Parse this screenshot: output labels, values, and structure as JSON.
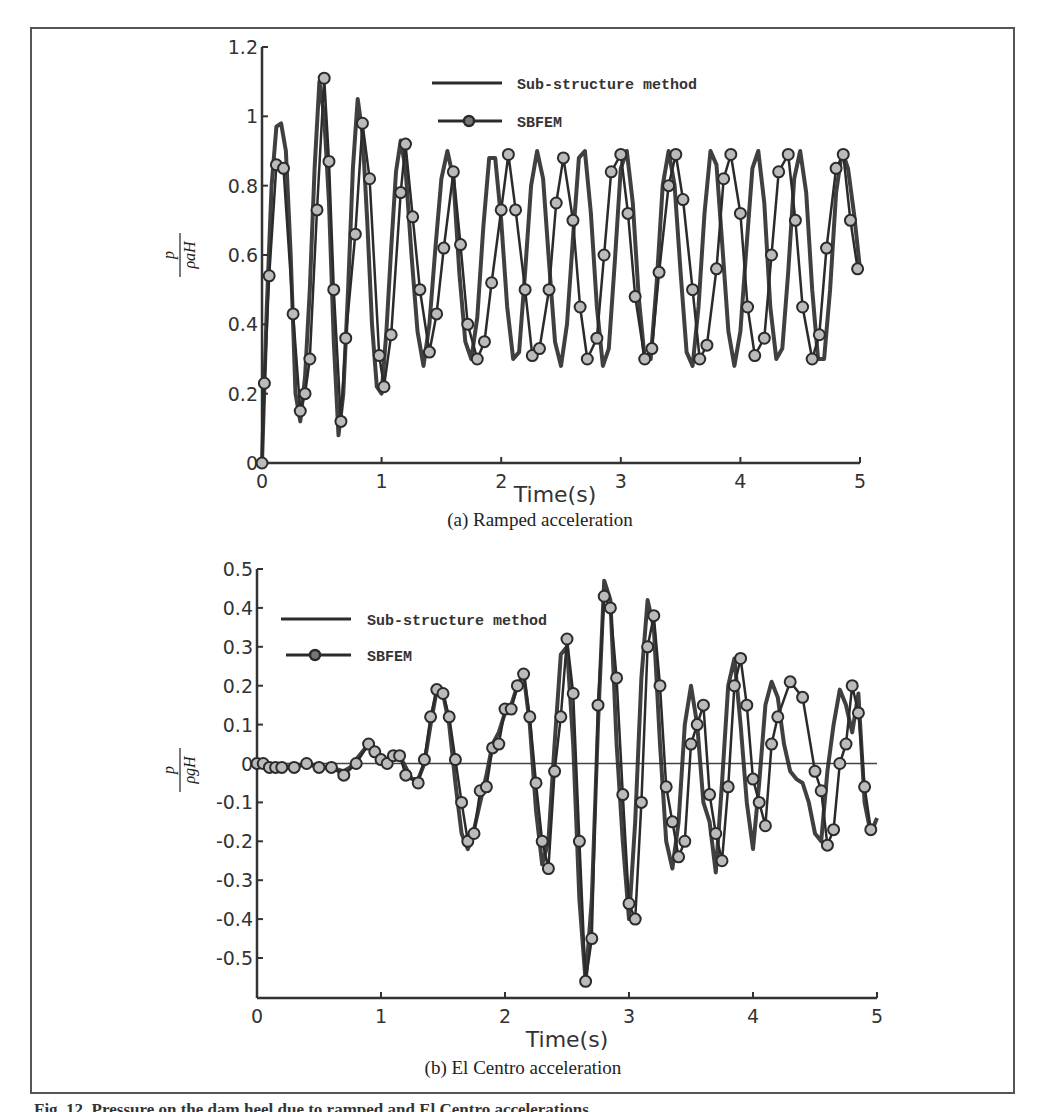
{
  "figure": {
    "caption": "Fig. 12. Pressure on the dam heel due to ramped and El Centro accelerations",
    "frame_color": "#555555",
    "line_color": "#2b2b2b"
  },
  "chart_data": [
    {
      "type": "line",
      "panel": "a",
      "subcaption": "(a) Ramped acceleration",
      "title": "",
      "xlabel": "Time(s)",
      "ylabel": "p / ρ a H",
      "ylabel_num": "p",
      "ylabel_den": "ρaH",
      "xlim": [
        0,
        5
      ],
      "ylim": [
        0,
        1.2
      ],
      "xticks": [
        "0",
        "1",
        "2",
        "3",
        "4",
        "5"
      ],
      "yticks": [
        "0",
        "0.2",
        "0.4",
        "0.6",
        "0.8",
        "1",
        "1.2"
      ],
      "grid": false,
      "legend_position": "upper center",
      "legend": [
        "Sub-structure method",
        "SBFEM"
      ],
      "series": [
        {
          "name": "Sub-structure method",
          "marker": "none",
          "x": [
            0,
            0.04,
            0.08,
            0.12,
            0.16,
            0.2,
            0.24,
            0.28,
            0.32,
            0.36,
            0.4,
            0.44,
            0.48,
            0.52,
            0.56,
            0.6,
            0.64,
            0.68,
            0.72,
            0.76,
            0.8,
            0.84,
            0.88,
            0.92,
            0.96,
            1.0,
            1.04,
            1.08,
            1.12,
            1.16,
            1.2,
            1.25,
            1.3,
            1.35,
            1.4,
            1.45,
            1.5,
            1.55,
            1.6,
            1.65,
            1.7,
            1.75,
            1.8,
            1.85,
            1.9,
            1.95,
            2.0,
            2.05,
            2.1,
            2.15,
            2.2,
            2.25,
            2.3,
            2.35,
            2.4,
            2.45,
            2.5,
            2.55,
            2.6,
            2.65,
            2.7,
            2.75,
            2.8,
            2.85,
            2.9,
            2.95,
            3.0,
            3.05,
            3.1,
            3.15,
            3.2,
            3.25,
            3.3,
            3.35,
            3.4,
            3.45,
            3.5,
            3.55,
            3.6,
            3.65,
            3.7,
            3.75,
            3.8,
            3.85,
            3.9,
            3.95,
            4.0,
            4.05,
            4.1,
            4.15,
            4.2,
            4.25,
            4.3,
            4.35,
            4.4,
            4.45,
            4.5,
            4.55,
            4.6,
            4.65,
            4.7,
            4.75,
            4.8,
            4.85,
            4.9,
            4.95,
            5.0
          ],
          "values": [
            0,
            0.45,
            0.8,
            0.97,
            0.98,
            0.9,
            0.6,
            0.2,
            0.12,
            0.25,
            0.5,
            0.85,
            1.1,
            1.0,
            0.75,
            0.35,
            0.08,
            0.2,
            0.5,
            0.85,
            1.05,
            0.95,
            0.7,
            0.4,
            0.22,
            0.2,
            0.38,
            0.62,
            0.84,
            0.93,
            0.85,
            0.6,
            0.38,
            0.28,
            0.4,
            0.62,
            0.82,
            0.9,
            0.82,
            0.55,
            0.35,
            0.3,
            0.42,
            0.68,
            0.88,
            0.88,
            0.7,
            0.45,
            0.3,
            0.32,
            0.55,
            0.8,
            0.9,
            0.82,
            0.58,
            0.35,
            0.28,
            0.4,
            0.65,
            0.88,
            0.9,
            0.72,
            0.45,
            0.28,
            0.33,
            0.58,
            0.85,
            0.9,
            0.75,
            0.48,
            0.3,
            0.3,
            0.52,
            0.8,
            0.9,
            0.8,
            0.55,
            0.32,
            0.28,
            0.45,
            0.72,
            0.9,
            0.86,
            0.62,
            0.38,
            0.28,
            0.38,
            0.62,
            0.85,
            0.9,
            0.75,
            0.45,
            0.3,
            0.33,
            0.55,
            0.82,
            0.9,
            0.78,
            0.5,
            0.3,
            0.3,
            0.5,
            0.78,
            0.9,
            0.85,
            0.72,
            0.56
          ]
        },
        {
          "name": "SBFEM",
          "marker": "circle",
          "x": [
            0,
            0.02,
            0.06,
            0.12,
            0.18,
            0.26,
            0.32,
            0.36,
            0.4,
            0.46,
            0.52,
            0.56,
            0.6,
            0.66,
            0.7,
            0.78,
            0.84,
            0.9,
            0.98,
            1.02,
            1.08,
            1.16,
            1.2,
            1.26,
            1.32,
            1.4,
            1.46,
            1.52,
            1.6,
            1.66,
            1.72,
            1.8,
            1.86,
            1.92,
            2.0,
            2.06,
            2.12,
            2.2,
            2.26,
            2.32,
            2.4,
            2.46,
            2.52,
            2.6,
            2.66,
            2.72,
            2.8,
            2.86,
            2.92,
            3.0,
            3.06,
            3.12,
            3.2,
            3.26,
            3.32,
            3.4,
            3.46,
            3.52,
            3.6,
            3.66,
            3.72,
            3.8,
            3.86,
            3.92,
            4.0,
            4.06,
            4.12,
            4.2,
            4.26,
            4.32,
            4.4,
            4.46,
            4.52,
            4.6,
            4.66,
            4.72,
            4.8,
            4.86,
            4.92,
            4.98
          ],
          "values": [
            0,
            0.23,
            0.54,
            0.86,
            0.85,
            0.43,
            0.15,
            0.2,
            0.3,
            0.73,
            1.11,
            0.87,
            0.5,
            0.12,
            0.36,
            0.66,
            0.98,
            0.82,
            0.31,
            0.22,
            0.37,
            0.78,
            0.92,
            0.71,
            0.5,
            0.32,
            0.43,
            0.62,
            0.84,
            0.63,
            0.4,
            0.3,
            0.35,
            0.52,
            0.73,
            0.89,
            0.73,
            0.5,
            0.31,
            0.33,
            0.5,
            0.75,
            0.88,
            0.7,
            0.45,
            0.3,
            0.36,
            0.6,
            0.84,
            0.89,
            0.72,
            0.48,
            0.3,
            0.33,
            0.55,
            0.8,
            0.89,
            0.76,
            0.5,
            0.3,
            0.34,
            0.56,
            0.82,
            0.89,
            0.72,
            0.45,
            0.31,
            0.36,
            0.6,
            0.84,
            0.89,
            0.7,
            0.45,
            0.3,
            0.37,
            0.62,
            0.85,
            0.89,
            0.7,
            0.56
          ]
        }
      ]
    },
    {
      "type": "line",
      "panel": "b",
      "subcaption": "(b) El Centro acceleration",
      "title": "",
      "xlabel": "Time(s)",
      "ylabel": "p / ρ g H",
      "ylabel_num": "p",
      "ylabel_den": "ρgH",
      "xlim": [
        0,
        5
      ],
      "ylim": [
        -0.6,
        0.5
      ],
      "xticks": [
        "0",
        "1",
        "2",
        "3",
        "4",
        "5"
      ],
      "yticks": [
        "-0.5",
        "-0.4",
        "-0.3",
        "-0.2",
        "-0.1",
        "0",
        "0.1",
        "0.2",
        "0.3",
        "0.4",
        "0.5"
      ],
      "grid": false,
      "zero_line": true,
      "legend_position": "upper left",
      "legend": [
        "Sub-structure method",
        "SBFEM"
      ],
      "series": [
        {
          "name": "Sub-structure method",
          "marker": "none",
          "x": [
            0,
            0.1,
            0.2,
            0.3,
            0.4,
            0.5,
            0.6,
            0.7,
            0.75,
            0.8,
            0.85,
            0.9,
            0.95,
            1.0,
            1.05,
            1.1,
            1.15,
            1.2,
            1.25,
            1.3,
            1.35,
            1.4,
            1.45,
            1.5,
            1.55,
            1.6,
            1.65,
            1.7,
            1.75,
            1.8,
            1.85,
            1.9,
            1.95,
            2.0,
            2.05,
            2.1,
            2.15,
            2.2,
            2.25,
            2.3,
            2.35,
            2.4,
            2.45,
            2.5,
            2.55,
            2.6,
            2.65,
            2.7,
            2.75,
            2.8,
            2.85,
            2.9,
            2.95,
            3.0,
            3.05,
            3.1,
            3.15,
            3.2,
            3.25,
            3.3,
            3.35,
            3.4,
            3.45,
            3.5,
            3.55,
            3.6,
            3.65,
            3.7,
            3.75,
            3.8,
            3.85,
            3.9,
            3.95,
            4.0,
            4.05,
            4.1,
            4.15,
            4.2,
            4.25,
            4.3,
            4.35,
            4.4,
            4.45,
            4.5,
            4.55,
            4.6,
            4.65,
            4.7,
            4.75,
            4.8,
            4.85,
            4.9,
            4.95,
            5.0
          ],
          "values": [
            0,
            -0.01,
            -0.01,
            -0.01,
            0,
            -0.01,
            -0.01,
            -0.02,
            -0.01,
            0.01,
            0.03,
            0.05,
            0.04,
            0.01,
            0,
            0.02,
            0.02,
            -0.01,
            -0.04,
            -0.04,
            0,
            0.1,
            0.19,
            0.18,
            0.1,
            -0.05,
            -0.18,
            -0.22,
            -0.17,
            -0.1,
            -0.03,
            0.05,
            0.08,
            0.13,
            0.15,
            0.2,
            0.23,
            0.1,
            -0.12,
            -0.26,
            -0.2,
            0.05,
            0.28,
            0.3,
            0.05,
            -0.35,
            -0.56,
            -0.35,
            0.1,
            0.47,
            0.42,
            0.05,
            -0.2,
            -0.4,
            -0.15,
            0.22,
            0.42,
            0.35,
            0.05,
            -0.2,
            -0.27,
            -0.15,
            0.1,
            0.2,
            0.1,
            -0.1,
            -0.15,
            -0.28,
            -0.05,
            0.2,
            0.27,
            0.1,
            -0.1,
            -0.22,
            -0.05,
            0.15,
            0.21,
            0.17,
            0.05,
            -0.02,
            -0.04,
            -0.05,
            -0.1,
            -0.18,
            -0.2,
            -0.02,
            0.1,
            0.19,
            0.15,
            0.08,
            0.18,
            -0.1,
            -0.18,
            -0.14
          ]
        },
        {
          "name": "SBFEM",
          "marker": "circle",
          "x": [
            0,
            0.05,
            0.1,
            0.15,
            0.2,
            0.3,
            0.4,
            0.5,
            0.6,
            0.7,
            0.8,
            0.9,
            0.95,
            1.0,
            1.05,
            1.1,
            1.15,
            1.2,
            1.3,
            1.35,
            1.4,
            1.45,
            1.5,
            1.55,
            1.6,
            1.65,
            1.7,
            1.75,
            1.8,
            1.85,
            1.9,
            1.95,
            2.0,
            2.05,
            2.1,
            2.15,
            2.2,
            2.25,
            2.3,
            2.35,
            2.4,
            2.45,
            2.5,
            2.55,
            2.6,
            2.65,
            2.7,
            2.75,
            2.8,
            2.85,
            2.9,
            2.95,
            3.0,
            3.05,
            3.1,
            3.15,
            3.2,
            3.25,
            3.3,
            3.35,
            3.4,
            3.45,
            3.5,
            3.55,
            3.6,
            3.65,
            3.7,
            3.75,
            3.8,
            3.85,
            3.9,
            3.95,
            4.0,
            4.05,
            4.1,
            4.15,
            4.2,
            4.3,
            4.4,
            4.5,
            4.55,
            4.6,
            4.65,
            4.7,
            4.75,
            4.8,
            4.85,
            4.9,
            4.95
          ],
          "values": [
            0,
            0,
            -0.01,
            -0.01,
            -0.01,
            -0.01,
            0,
            -0.01,
            -0.01,
            -0.03,
            0,
            0.05,
            0.03,
            0.01,
            0,
            0.02,
            0.02,
            -0.03,
            -0.05,
            0.01,
            0.12,
            0.19,
            0.18,
            0.12,
            0.01,
            -0.1,
            -0.2,
            -0.18,
            -0.07,
            -0.06,
            0.04,
            0.05,
            0.14,
            0.14,
            0.2,
            0.23,
            0.12,
            -0.05,
            -0.2,
            -0.27,
            -0.02,
            0.12,
            0.32,
            0.18,
            -0.2,
            -0.56,
            -0.45,
            0.15,
            0.43,
            0.4,
            0.22,
            -0.08,
            -0.36,
            -0.4,
            -0.1,
            0.3,
            0.38,
            0.2,
            -0.06,
            -0.15,
            -0.24,
            -0.2,
            0.05,
            0.1,
            0.15,
            -0.08,
            -0.18,
            -0.25,
            -0.06,
            0.2,
            0.27,
            0.15,
            -0.04,
            -0.1,
            -0.16,
            0.05,
            0.12,
            0.21,
            0.17,
            -0.02,
            -0.07,
            -0.21,
            -0.17,
            0.0,
            0.05,
            0.2,
            0.13,
            -0.06,
            -0.17
          ]
        }
      ]
    }
  ]
}
